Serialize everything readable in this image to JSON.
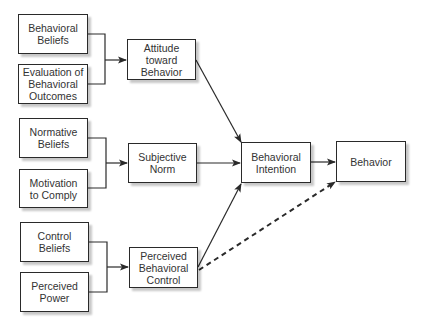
{
  "diagram": {
    "nodes": {
      "behavioral_beliefs": "Behavioral\nBeliefs",
      "evaluation_outcomes": "Evaluation of\nBehavioral\nOutcomes",
      "attitude": "Attitude\ntoward\nBehavior",
      "normative_beliefs": "Normative\nBeliefs",
      "motivation_comply": "Motivation\nto Comply",
      "subjective_norm": "Subjective\nNorm",
      "control_beliefs": "Control\nBeliefs",
      "perceived_power": "Perceived\nPower",
      "pbc": "Perceived\nBehavioral\nControl",
      "intention": "Behavioral\nIntention",
      "behavior": "Behavior"
    },
    "edges": [
      {
        "from": [
          "behavioral_beliefs",
          "evaluation_outcomes"
        ],
        "to": "attitude",
        "style": "solid"
      },
      {
        "from": [
          "normative_beliefs",
          "motivation_comply"
        ],
        "to": "subjective_norm",
        "style": "solid"
      },
      {
        "from": [
          "control_beliefs",
          "perceived_power"
        ],
        "to": "pbc",
        "style": "solid"
      },
      {
        "from": "attitude",
        "to": "intention",
        "style": "solid"
      },
      {
        "from": "subjective_norm",
        "to": "intention",
        "style": "solid"
      },
      {
        "from": "pbc",
        "to": "intention",
        "style": "solid"
      },
      {
        "from": "intention",
        "to": "behavior",
        "style": "solid"
      },
      {
        "from": "pbc",
        "to": "behavior",
        "style": "dashed"
      }
    ],
    "colors": {
      "stroke": "#2a2a2a",
      "text": "#333333",
      "background": "#ffffff"
    }
  }
}
